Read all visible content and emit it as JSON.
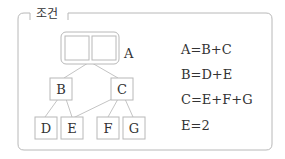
{
  "panel": {
    "title": "조건"
  },
  "tree": {
    "root": {
      "label": "A",
      "slots": 2
    },
    "level1": [
      {
        "label": "B"
      },
      {
        "label": "C"
      }
    ],
    "level2": [
      {
        "label": "D"
      },
      {
        "label": "E"
      },
      {
        "label": "F"
      },
      {
        "label": "G"
      }
    ],
    "edges": [
      [
        "A",
        "B"
      ],
      [
        "A",
        "C"
      ],
      [
        "B",
        "D"
      ],
      [
        "B",
        "E"
      ],
      [
        "C",
        "E"
      ],
      [
        "C",
        "F"
      ],
      [
        "C",
        "G"
      ]
    ]
  },
  "equations": [
    "A=B+C",
    "B=D+E",
    "C=E+F+G",
    "E=2"
  ],
  "colors": {
    "border": "#b8b8b8",
    "text": "#333333"
  }
}
